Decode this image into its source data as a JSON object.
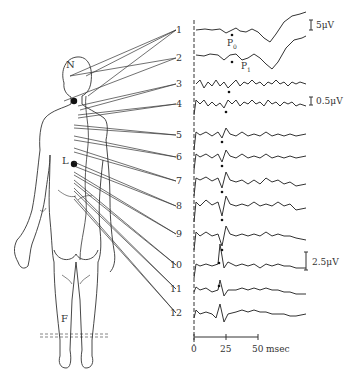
{
  "figure": {
    "body_labels": {
      "N": "N",
      "L": "L",
      "F": "F"
    },
    "traces": [
      {
        "id": "1",
        "label": "1",
        "y": 30
      },
      {
        "id": "2",
        "label": "2",
        "y": 58
      },
      {
        "id": "3",
        "label": "3",
        "y": 84
      },
      {
        "id": "4",
        "label": "4",
        "y": 104
      },
      {
        "id": "5",
        "label": "5",
        "y": 135
      },
      {
        "id": "6",
        "label": "6",
        "y": 157
      },
      {
        "id": "7",
        "label": "7",
        "y": 181
      },
      {
        "id": "8",
        "label": "8",
        "y": 206
      },
      {
        "id": "9",
        "label": "9",
        "y": 234
      },
      {
        "id": "10",
        "label": "10",
        "y": 265
      },
      {
        "id": "11",
        "label": "11",
        "y": 289
      },
      {
        "id": "12",
        "label": "12",
        "y": 313
      }
    ],
    "peak_labels": {
      "p0": "P",
      "p0_sub": "0",
      "p1": "P",
      "p1_sub": "1"
    },
    "scale_bars": [
      {
        "label": "5μV",
        "applies_to": "traces 1-2"
      },
      {
        "label": "0.5μV",
        "applies_to": "traces 3-4"
      },
      {
        "label": "2.5μV",
        "applies_to": "traces 5-12"
      }
    ],
    "time_axis": {
      "ticks": [
        "0",
        "25",
        "50"
      ],
      "unit": "msec"
    },
    "colors": {
      "ink": "#333333",
      "background": "#ffffff"
    }
  }
}
